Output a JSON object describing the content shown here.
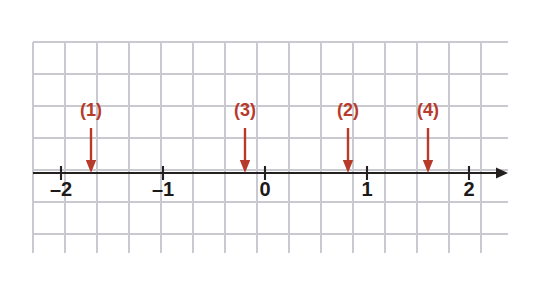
{
  "figure": {
    "kind": "number-line-diagram",
    "background_color": "#ffffff",
    "grid": {
      "visible": true,
      "color": "#c9c9d2",
      "spacing_px": 32,
      "left_px": 33,
      "top_px": 42,
      "right_px": 508,
      "bottom_px": 253,
      "columns": 15,
      "rows": 7
    },
    "axis": {
      "color": "#23201f",
      "y_px": 173,
      "start_px": 33,
      "end_px": 508,
      "arrow_direction": "right",
      "unit_px": 102,
      "origin_px": 265,
      "ticks": [
        {
          "label": "–2",
          "value": -2,
          "x_px": 61
        },
        {
          "label": "–1",
          "value": -1,
          "x_px": 163
        },
        {
          "label": "0",
          "value": 0,
          "x_px": 265
        },
        {
          "label": "1",
          "value": 1,
          "x_px": 367
        },
        {
          "label": "2",
          "value": 2,
          "x_px": 469
        }
      ],
      "tick_label_y_px": 196
    },
    "markers": {
      "color": "#b83a2b",
      "label_y_px": 116,
      "shaft_top_px": 128,
      "shaft_bottom_px": 163,
      "head_tip_px": 173,
      "items": [
        {
          "label": "(1)",
          "x_px": 91,
          "value": -1.71
        },
        {
          "label": "(3)",
          "x_px": 245,
          "value": -0.2
        },
        {
          "label": "(2)",
          "x_px": 348,
          "value": 0.81
        },
        {
          "label": "(4)",
          "x_px": 428,
          "value": 1.6
        }
      ]
    }
  },
  "chart_data": {
    "type": "scatter",
    "title": "",
    "xlabel": "",
    "ylabel": "",
    "xlim": [
      -2.3,
      2.4
    ],
    "grid": true,
    "legend": "none",
    "categories": [
      "(1)",
      "(3)",
      "(2)",
      "(4)"
    ],
    "x": [
      -1.71,
      -0.2,
      0.81,
      1.6
    ],
    "tick_labels": [
      "–2",
      "–1",
      "0",
      "1",
      "2"
    ],
    "tick_values": [
      -2,
      -1,
      0,
      1,
      2
    ],
    "annotations": [
      {
        "text": "(1)",
        "x": -1.71,
        "style": "down-arrow",
        "color": "#b83a2b"
      },
      {
        "text": "(3)",
        "x": -0.2,
        "style": "down-arrow",
        "color": "#b83a2b"
      },
      {
        "text": "(2)",
        "x": 0.81,
        "style": "down-arrow",
        "color": "#b83a2b"
      },
      {
        "text": "(4)",
        "x": 1.6,
        "style": "down-arrow",
        "color": "#b83a2b"
      }
    ]
  }
}
